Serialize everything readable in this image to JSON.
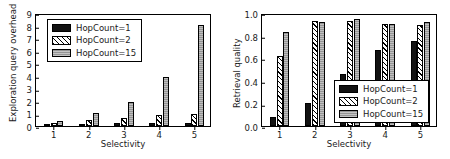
{
  "figure": {
    "background": "#ffffff",
    "panels": 2
  },
  "chart_data": [
    {
      "type": "bar",
      "title": "",
      "xlabel": "Selectivity",
      "ylabel": "Exploration query overhead",
      "categories": [
        "1",
        "2",
        "3",
        "4",
        "5"
      ],
      "xticklabels": [
        "1",
        "2",
        "3",
        "4",
        "5"
      ],
      "yticklabels": [
        "0",
        "1",
        "2",
        "3",
        "4",
        "5",
        "6",
        "7",
        "8",
        "9"
      ],
      "ylim": [
        0,
        9
      ],
      "ytick_values": [
        0,
        1,
        2,
        3,
        4,
        5,
        6,
        7,
        8,
        9
      ],
      "grid": false,
      "legend_position": "upper left",
      "series": [
        {
          "name": "HopCount=1",
          "color": "#121212",
          "pattern": "solid",
          "values": [
            0.18,
            0.19,
            0.24,
            0.27,
            0.28
          ]
        },
        {
          "name": "HopCount=2",
          "color": "#ffffff",
          "pattern": "hatch-diagonal",
          "values": [
            0.21,
            0.46,
            0.62,
            0.85,
            0.95
          ]
        },
        {
          "name": "HopCount=15",
          "color": "#9d9d9d",
          "pattern": "gray",
          "values": [
            0.37,
            1.02,
            1.95,
            3.88,
            8.02
          ]
        }
      ]
    },
    {
      "type": "bar",
      "title": "",
      "xlabel": "Selectivity",
      "ylabel": "Retrieval quality",
      "categories": [
        "1",
        "2",
        "3",
        "4",
        "5"
      ],
      "xticklabels": [
        "1",
        "2",
        "3",
        "4",
        "5"
      ],
      "yticklabels": [
        "0.0",
        "0.2",
        "0.4",
        "0.6",
        "0.8",
        "1.0"
      ],
      "ylim": [
        0.0,
        1.0
      ],
      "ytick_values": [
        0.0,
        0.2,
        0.4,
        0.6,
        0.8,
        1.0
      ],
      "grid": false,
      "legend_position": "lower right",
      "series": [
        {
          "name": "HopCount=1",
          "color": "#121212",
          "pattern": "solid",
          "values": [
            0.08,
            0.2,
            0.46,
            0.67,
            0.75
          ]
        },
        {
          "name": "HopCount=2",
          "color": "#ffffff",
          "pattern": "hatch-diagonal",
          "values": [
            0.62,
            0.93,
            0.93,
            0.9,
            0.89
          ]
        },
        {
          "name": "HopCount=15",
          "color": "#9d9d9d",
          "pattern": "gray",
          "values": [
            0.83,
            0.92,
            0.95,
            0.9,
            0.92
          ]
        }
      ]
    }
  ]
}
